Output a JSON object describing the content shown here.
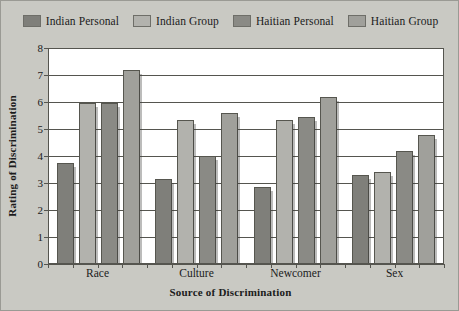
{
  "figure": {
    "background_color": "#c9c9c3",
    "plot_background_color": "#ffffff",
    "axis_color": "#55554f"
  },
  "legend": {
    "position": "top-center",
    "entries": [
      {
        "label": "Indian Personal",
        "color": "#7f7f7a"
      },
      {
        "label": "Indian Group",
        "color": "#b2b2ad"
      },
      {
        "label": "Haitian Personal",
        "color": "#8a8a85"
      },
      {
        "label": "Haitian Group",
        "color": "#a0a09b"
      }
    ]
  },
  "axes": {
    "ylabel": "Rating of Discrimination",
    "xlabel": "Source of Discrimination",
    "yticks": [
      0,
      1,
      2,
      3,
      4,
      5,
      6,
      7,
      8
    ],
    "ylim": [
      0,
      8
    ],
    "grid": true
  },
  "chart_data": {
    "type": "bar",
    "title": "",
    "xlabel": "Source of Discrimination",
    "ylabel": "Rating of Discrimination",
    "ylim": [
      0,
      8
    ],
    "yticks": [
      0,
      1,
      2,
      3,
      4,
      5,
      6,
      7,
      8
    ],
    "grid": true,
    "legend_position": "top-center",
    "categories": [
      "Race",
      "Culture",
      "Newcomer",
      "Sex"
    ],
    "series": [
      {
        "name": "Indian Personal",
        "color": "#7f7f7a",
        "values": [
          3.75,
          3.15,
          2.85,
          3.3
        ]
      },
      {
        "name": "Indian Group",
        "color": "#b2b2ad",
        "values": [
          6.0,
          5.35,
          5.35,
          3.4
        ]
      },
      {
        "name": "Haitian Personal",
        "color": "#8a8a85",
        "values": [
          6.0,
          4.0,
          5.45,
          4.2
        ]
      },
      {
        "name": "Haitian Group",
        "color": "#a0a09b",
        "values": [
          7.2,
          5.6,
          6.2,
          4.8
        ]
      }
    ]
  }
}
